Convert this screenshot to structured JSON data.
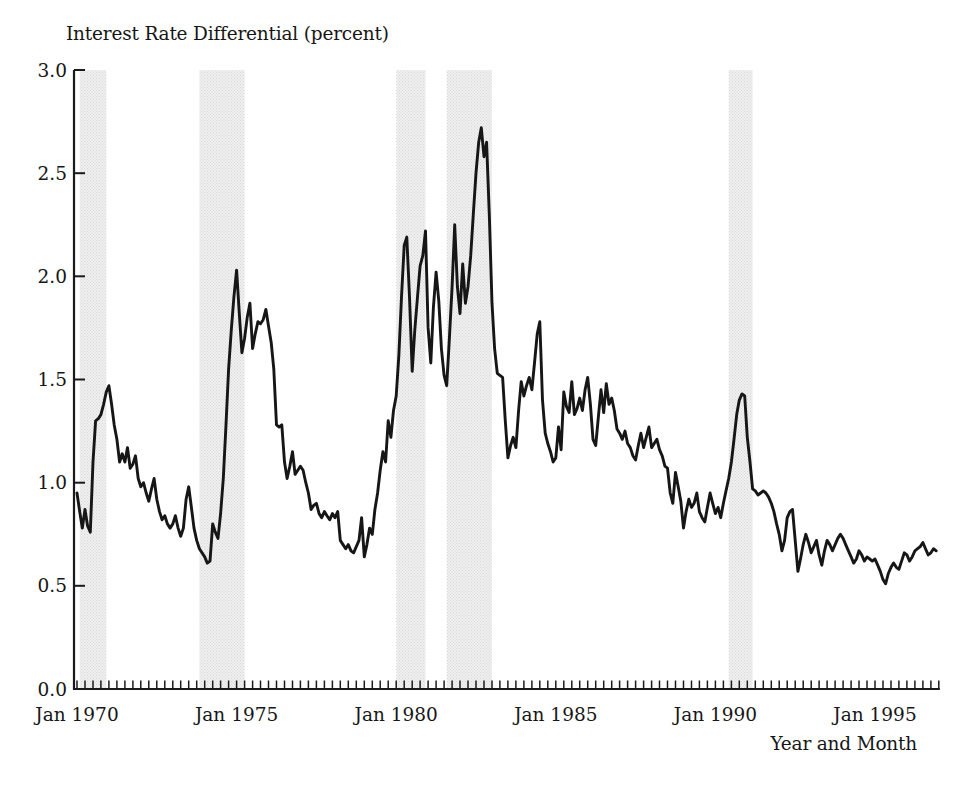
{
  "page": {
    "background": "#ffffff"
  },
  "chart_data": {
    "type": "line",
    "title": "Interest Rate Differential (percent)",
    "xlabel": "Year and Month",
    "series_name": "interest-rate-differential",
    "frequency": "monthly",
    "x_start": "1970-01",
    "x_end": "1996-12",
    "ylim": [
      0.0,
      3.0
    ],
    "grid": false,
    "legend": "none",
    "line_color": "#161616",
    "axis_color": "#1a1a1a",
    "band_base_color": "#f0f0f0",
    "band_dot_color": "#d7d7d7",
    "y_ticks": [
      0.0,
      0.5,
      1.0,
      1.5,
      2.0,
      2.5,
      3.0
    ],
    "y_tick_labels": [
      "0.0",
      "0.5",
      "1.0",
      "1.5",
      "2.0",
      "2.5",
      "3.0"
    ],
    "x_tick_months": [
      0,
      60,
      120,
      180,
      240,
      300
    ],
    "x_tick_labels": [
      "Jan 1970",
      "Jan 1975",
      "Jan 1980",
      "Jan 1985",
      "Jan 1990",
      "Jan 1995"
    ],
    "x_minor_tick_interval_months": 3,
    "recession_bands": [
      {
        "from": "1970-02",
        "to": "1970-12"
      },
      {
        "from": "1973-11",
        "to": "1975-04"
      },
      {
        "from": "1980-01",
        "to": "1980-12"
      },
      {
        "from": "1981-08",
        "to": "1983-01"
      },
      {
        "from": "1990-06",
        "to": "1991-03"
      }
    ],
    "values": [
      0.95,
      0.86,
      0.78,
      0.87,
      0.79,
      0.76,
      1.1,
      1.3,
      1.31,
      1.33,
      1.38,
      1.44,
      1.47,
      1.38,
      1.28,
      1.21,
      1.1,
      1.14,
      1.1,
      1.17,
      1.07,
      1.09,
      1.13,
      1.02,
      0.98,
      1.0,
      0.95,
      0.91,
      0.97,
      1.02,
      0.92,
      0.86,
      0.82,
      0.84,
      0.8,
      0.78,
      0.8,
      0.84,
      0.78,
      0.74,
      0.78,
      0.92,
      0.98,
      0.88,
      0.78,
      0.72,
      0.68,
      0.66,
      0.64,
      0.61,
      0.62,
      0.8,
      0.76,
      0.73,
      0.85,
      1.02,
      1.28,
      1.55,
      1.74,
      1.9,
      2.03,
      1.82,
      1.63,
      1.7,
      1.8,
      1.87,
      1.65,
      1.72,
      1.78,
      1.77,
      1.79,
      1.84,
      1.76,
      1.68,
      1.55,
      1.28,
      1.27,
      1.28,
      1.1,
      1.02,
      1.08,
      1.15,
      1.04,
      1.06,
      1.08,
      1.06,
      1.0,
      0.95,
      0.87,
      0.89,
      0.9,
      0.85,
      0.83,
      0.86,
      0.84,
      0.82,
      0.85,
      0.83,
      0.86,
      0.72,
      0.7,
      0.68,
      0.7,
      0.67,
      0.66,
      0.69,
      0.72,
      0.83,
      0.64,
      0.7,
      0.78,
      0.75,
      0.87,
      0.95,
      1.06,
      1.15,
      1.1,
      1.3,
      1.22,
      1.35,
      1.42,
      1.62,
      1.9,
      2.15,
      2.19,
      1.9,
      1.54,
      1.74,
      1.9,
      2.05,
      2.1,
      2.22,
      1.75,
      1.58,
      1.85,
      2.02,
      1.88,
      1.65,
      1.52,
      1.47,
      1.7,
      1.95,
      2.25,
      1.95,
      1.82,
      2.06,
      1.87,
      1.95,
      2.1,
      2.3,
      2.5,
      2.65,
      2.72,
      2.58,
      2.65,
      2.3,
      1.87,
      1.65,
      1.53,
      1.52,
      1.51,
      1.3,
      1.12,
      1.18,
      1.22,
      1.17,
      1.35,
      1.49,
      1.42,
      1.47,
      1.51,
      1.45,
      1.58,
      1.72,
      1.78,
      1.4,
      1.24,
      1.19,
      1.15,
      1.1,
      1.12,
      1.27,
      1.16,
      1.44,
      1.37,
      1.34,
      1.49,
      1.33,
      1.36,
      1.41,
      1.35,
      1.45,
      1.51,
      1.38,
      1.21,
      1.18,
      1.32,
      1.45,
      1.34,
      1.48,
      1.38,
      1.41,
      1.35,
      1.26,
      1.24,
      1.21,
      1.25,
      1.19,
      1.17,
      1.13,
      1.11,
      1.18,
      1.24,
      1.17,
      1.22,
      1.27,
      1.17,
      1.19,
      1.21,
      1.16,
      1.13,
      1.08,
      1.07,
      0.95,
      0.9,
      1.05,
      0.98,
      0.91,
      0.78,
      0.86,
      0.92,
      0.88,
      0.9,
      0.95,
      0.86,
      0.83,
      0.81,
      0.88,
      0.95,
      0.9,
      0.85,
      0.88,
      0.83,
      0.9,
      0.96,
      1.02,
      1.1,
      1.21,
      1.33,
      1.4,
      1.43,
      1.42,
      1.22,
      1.1,
      0.97,
      0.96,
      0.94,
      0.95,
      0.96,
      0.95,
      0.93,
      0.9,
      0.86,
      0.8,
      0.75,
      0.67,
      0.72,
      0.83,
      0.86,
      0.87,
      0.72,
      0.57,
      0.63,
      0.7,
      0.75,
      0.71,
      0.66,
      0.69,
      0.72,
      0.65,
      0.6,
      0.67,
      0.72,
      0.7,
      0.67,
      0.7,
      0.73,
      0.75,
      0.73,
      0.7,
      0.67,
      0.64,
      0.61,
      0.63,
      0.67,
      0.65,
      0.62,
      0.64,
      0.63,
      0.62,
      0.63,
      0.6,
      0.57,
      0.53,
      0.51,
      0.56,
      0.59,
      0.61,
      0.59,
      0.58,
      0.62,
      0.66,
      0.65,
      0.62,
      0.64,
      0.67,
      0.68,
      0.69,
      0.71,
      0.68,
      0.65,
      0.66,
      0.68,
      0.67
    ]
  }
}
